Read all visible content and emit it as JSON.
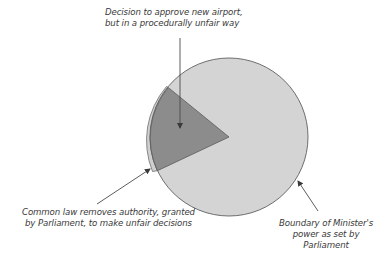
{
  "diagram": {
    "type": "concept-diagram",
    "colors": {
      "background": "#ffffff",
      "boundary_fill": "#d4d4d4",
      "boundary_stroke": "#6e6e6e",
      "decision_wedge_fill": "#8c8c8c",
      "common_law_band_fill": "#cfcfcf",
      "arrow": "#4a4a4a",
      "text": "#3a3a3a"
    },
    "labels": {
      "decision": {
        "lines": [
          "Decision to approve new airport,",
          "but in a procedurally unfair way"
        ]
      },
      "common_law": {
        "lines": [
          "Common law removes authority, granted",
          "by Parliament, to make unfair decisions"
        ]
      },
      "boundary": {
        "lines": [
          "Boundary of Minister's",
          "power as set by",
          "Parliament"
        ]
      }
    },
    "shapes": [
      {
        "name": "boundary-circle",
        "represents": "Boundary of Minister's power as set by Parliament"
      },
      {
        "name": "decision-wedge",
        "represents": "Decision to approve new airport, but in a procedurally unfair way"
      },
      {
        "name": "common-law-band",
        "represents": "Common law removes authority, granted by Parliament, to make unfair decisions"
      }
    ]
  }
}
